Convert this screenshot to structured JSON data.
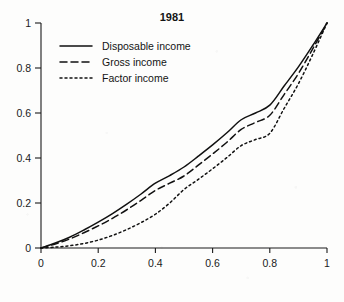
{
  "chart_data": {
    "type": "line",
    "title": "1981",
    "subtitle": "",
    "xlabel": "",
    "ylabel": "",
    "xlim": [
      0,
      1
    ],
    "ylim": [
      0,
      1
    ],
    "grid": false,
    "legend_position": "top-left",
    "x_ticks": [
      "0",
      "0.2",
      "0.4",
      "0.6",
      "0.8",
      "1"
    ],
    "x_tick_values": [
      0,
      0.2,
      0.4,
      0.6,
      0.8,
      1
    ],
    "y_ticks": [
      "0",
      "0.2",
      "0.4",
      "0.6",
      "0.8",
      "1"
    ],
    "y_tick_values": [
      0,
      0.2,
      0.4,
      0.6,
      0.8,
      1
    ],
    "x": [
      0,
      0.05,
      0.1,
      0.15,
      0.2,
      0.25,
      0.3,
      0.35,
      0.4,
      0.45,
      0.5,
      0.55,
      0.6,
      0.65,
      0.7,
      0.75,
      0.8,
      0.85,
      0.9,
      0.95,
      1
    ],
    "series": [
      {
        "name": "Disposable income",
        "style": "solid",
        "values": [
          0,
          0.022,
          0.048,
          0.08,
          0.115,
          0.153,
          0.195,
          0.24,
          0.288,
          0.322,
          0.36,
          0.408,
          0.458,
          0.512,
          0.57,
          0.6,
          0.635,
          0.72,
          0.805,
          0.9,
          1
        ]
      },
      {
        "name": "Gross income",
        "style": "dashed",
        "values": [
          0,
          0.018,
          0.04,
          0.068,
          0.098,
          0.132,
          0.17,
          0.212,
          0.256,
          0.288,
          0.32,
          0.368,
          0.418,
          0.47,
          0.527,
          0.558,
          0.59,
          0.682,
          0.775,
          0.885,
          1
        ]
      },
      {
        "name": "Factor income",
        "style": "dotted",
        "values": [
          0,
          0.004,
          0.01,
          0.02,
          0.035,
          0.056,
          0.082,
          0.113,
          0.15,
          0.2,
          0.26,
          0.305,
          0.352,
          0.402,
          0.455,
          0.482,
          0.51,
          0.62,
          0.73,
          0.86,
          1
        ]
      }
    ],
    "legend": [
      {
        "label": "Disposable income",
        "style": "solid"
      },
      {
        "label": "Gross income",
        "style": "dashed"
      },
      {
        "label": "Factor income",
        "style": "dotted"
      }
    ],
    "colors": {
      "line": "#111111",
      "axis": "#1a1a1a",
      "background": "#fdfdfc",
      "text": "#141414"
    }
  }
}
